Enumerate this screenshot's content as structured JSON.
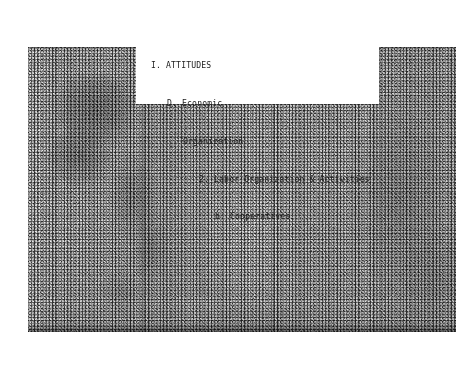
{
  "document": {
    "kind": "microfilm-scan",
    "background_color": "#ffffff"
  },
  "scan": {
    "name": "photostat-page-image",
    "paper_tone": "#dcdcdc",
    "ink_tone": "#1e1e1e",
    "notes_caption": "grainy halftone microfilm frame with vertical fold creases and dark emulsion blotches"
  },
  "caption_card": {
    "background_color": "#ffffff",
    "text_color": "#1b1b1b",
    "lines": [
      {
        "level": 1,
        "text": "I. ATTITUDES"
      },
      {
        "level": 2,
        "text": "D. Economic"
      },
      {
        "level": 3,
        "text": "Organization"
      },
      {
        "level": 4,
        "text": "2. Labor Organization & Activities"
      },
      {
        "level": 5,
        "text": "b. Cooperatives"
      }
    ],
    "line1": "I. ATTITUDES",
    "line2": "D. Economic",
    "line3": "Organization",
    "line4": "2. Labor Organization & Activities",
    "line5": "b. Cooperatives"
  }
}
